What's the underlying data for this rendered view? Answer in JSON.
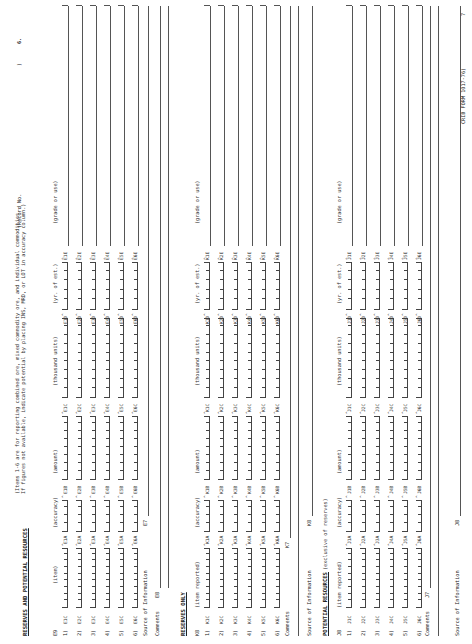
{
  "header": {
    "record_label": "(Record No.",
    "record_paren": ")",
    "page_number": "6."
  },
  "reserves_and_potential": {
    "title": "RESERVES AND POTENTIAL RESOURCES",
    "instructions_line1": "(Items 1-6 are for reporting combined ore, mixed commodity ore, and individual commodities.",
    "instructions_line2": " If figures not available, indicate potential by placing INS, MRD, or LOT in accuracy column.)",
    "field_code": "E9",
    "columns": [
      "(item)",
      "(accuracy)",
      "(amount)",
      "(thousand units)",
      "(yr. of est.)",
      "(grade or use)"
    ],
    "rows": [
      {
        "num": "1)",
        "codes": [
          "E1C",
          "E1A",
          "E1B",
          "E1C",
          "E1D",
          "E1E"
        ]
      },
      {
        "num": "2)",
        "codes": [
          "E2C",
          "E2A",
          "E2B",
          "E2C",
          "E2D",
          "E2E"
        ]
      },
      {
        "num": "3)",
        "codes": [
          "E3C",
          "E3A",
          "E3B",
          "E3C",
          "E3D",
          "E3E"
        ]
      },
      {
        "num": "4)",
        "codes": [
          "E4C",
          "E4A",
          "E4B",
          "E4C",
          "E4D",
          "E4E"
        ]
      },
      {
        "num": "5)",
        "codes": [
          "E5C",
          "E5A",
          "E5B",
          "E5C",
          "E5D",
          "E5E"
        ]
      },
      {
        "num": "6)",
        "codes": [
          "E6C",
          "E6A",
          "E6B",
          "E6C",
          "E6D",
          "E6E"
        ]
      }
    ],
    "source_label": "Source of Information",
    "source_code": "E7",
    "comments_label": "Comments",
    "comments_code": "E8"
  },
  "reserves_only": {
    "title": "RESERVES ONLY",
    "field_code": "K8",
    "columns": [
      "(item reported)",
      "(accuracy)",
      "(amount)",
      "(thousand units)",
      "(yr. of est.)",
      "(grade or use)"
    ],
    "rows": [
      {
        "num": "1)",
        "codes": [
          "K1C",
          "K1A",
          "K1B",
          "K1C",
          "K1D",
          "K1E"
        ]
      },
      {
        "num": "2)",
        "codes": [
          "K2C",
          "K2A",
          "K2B",
          "K2C",
          "K2D",
          "K2E"
        ]
      },
      {
        "num": "3)",
        "codes": [
          "K3C",
          "K3A",
          "K3B",
          "K3C",
          "K3D",
          "K3E"
        ]
      },
      {
        "num": "4)",
        "codes": [
          "K4C",
          "K4A",
          "K4B",
          "K4C",
          "K4D",
          "K4E"
        ]
      },
      {
        "num": "5)",
        "codes": [
          "K5C",
          "K5A",
          "K5B",
          "K5C",
          "K5D",
          "K5E"
        ]
      },
      {
        "num": "6)",
        "codes": [
          "K6C",
          "K6A",
          "K6B",
          "K6C",
          "K6D",
          "K6E"
        ]
      }
    ],
    "comments_label": "Comments",
    "comments_code": "K7",
    "source_label": "Source of Information",
    "source_code": "K8"
  },
  "potential_resources": {
    "title": "POTENTIAL RESOURCES",
    "subtitle": "(exclusive of reserves)",
    "field_code": "J8",
    "columns": [
      "(item reported)",
      "(accuracy)",
      "(amount)",
      "(thousand units)",
      "(yr. of est.)",
      "(grade or use)"
    ],
    "rows": [
      {
        "num": "1)",
        "codes": [
          "J1C",
          "J1A",
          "J1B",
          "J1C",
          "J1D",
          "J1E"
        ]
      },
      {
        "num": "2)",
        "codes": [
          "J2C",
          "J2A",
          "J2B",
          "J2C",
          "J2D",
          "J2E"
        ]
      },
      {
        "num": "3)",
        "codes": [
          "J3C",
          "J3A",
          "J3B",
          "J3C",
          "J3D",
          "J3E"
        ]
      },
      {
        "num": "4)",
        "codes": [
          "J4C",
          "J4A",
          "J4B",
          "J4C",
          "J4D",
          "J4E"
        ]
      },
      {
        "num": "5)",
        "codes": [
          "J5C",
          "J5A",
          "J5B",
          "J5C",
          "J5D",
          "J5E"
        ]
      },
      {
        "num": "6)",
        "codes": [
          "J6C",
          "J6A",
          "J6B",
          "J6C",
          "J6D",
          "J6E"
        ]
      }
    ],
    "comments_label": "Comments",
    "comments_code": "J7",
    "source_label": "Source of Information",
    "source_code": "J8"
  },
  "footer": {
    "form_number": "CRIB FORM 1017-76)",
    "corner_mark": "7"
  }
}
